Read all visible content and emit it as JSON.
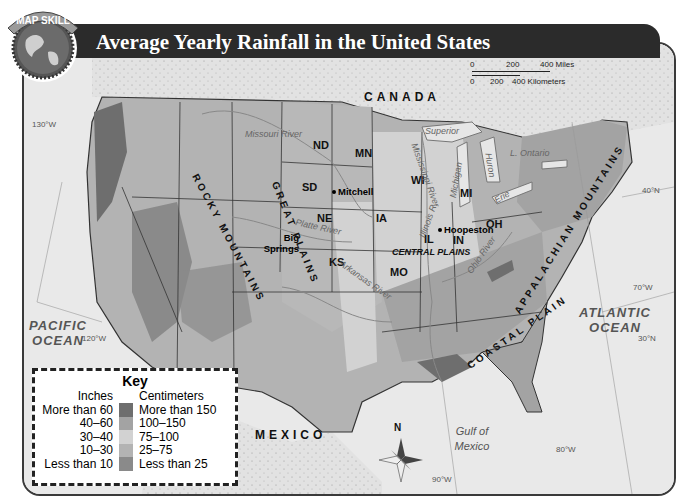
{
  "header": {
    "badge_label": "MAP SKILL",
    "title": "Average Yearly Rainfall in the United States"
  },
  "key": {
    "title": "Key",
    "col_inches": "Inches",
    "col_cm": "Centimeters",
    "rows": [
      {
        "inches": "More than 60",
        "cm": "More than 150",
        "color": "#6e6e6e"
      },
      {
        "inches": "40–60",
        "cm": "100–150",
        "color": "#a3a3a3"
      },
      {
        "inches": "30–40",
        "cm": "75–100",
        "color": "#d2d2d2"
      },
      {
        "inches": "10–30",
        "cm": "25–75",
        "color": "#b3b3b3"
      },
      {
        "inches": "Less than 10",
        "cm": "Less than 25",
        "color": "#8a8a8a"
      }
    ]
  },
  "scale_bar": {
    "miles": [
      "0",
      "200",
      "400 Miles"
    ],
    "km": [
      "0",
      "200",
      "400 Kilometers"
    ]
  },
  "labels": {
    "countries": {
      "canada": "CANADA",
      "mexico": "MEXICO"
    },
    "oceans": {
      "pacific": "PACIFIC OCEAN",
      "atlantic": "ATLANTIC OCEAN",
      "gulf": "Gulf of Mexico"
    },
    "states": [
      "ND",
      "MN",
      "SD",
      "NE",
      "KS",
      "IA",
      "MO",
      "WI",
      "MI",
      "IL",
      "IN",
      "OH"
    ],
    "cities": {
      "mitchell": "Mitchell",
      "big_springs": "Big Springs",
      "hoopeston": "Hoopeston"
    },
    "regions": {
      "rocky": "ROCKY MOUNTAINS",
      "great_plains": "GREAT PLAINS",
      "central_plains": "CENTRAL PLAINS",
      "appalachian": "APPALACHIAN MOUNTAINS",
      "coastal": "COASTAL PLAIN"
    },
    "rivers": [
      "Missouri River",
      "Platte River",
      "Arkansas River",
      "Mississippi River",
      "Illinois R.",
      "Ohio River"
    ],
    "lakes": [
      "Superior",
      "Michigan",
      "Huron",
      "Erie",
      "L. Ontario"
    ],
    "coordinates": [
      "130°W",
      "120°W",
      "90°W",
      "80°W",
      "70°W",
      "40°N",
      "30°N"
    ],
    "compass": "N"
  }
}
